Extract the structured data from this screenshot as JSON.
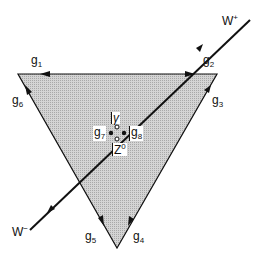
{
  "labels": {
    "g1": {
      "base": "g",
      "sub": "1"
    },
    "g2": {
      "base": "g",
      "sub": "2"
    },
    "g3": {
      "base": "g",
      "sub": "3"
    },
    "g4": {
      "base": "g",
      "sub": "4"
    },
    "g5": {
      "base": "g",
      "sub": "5"
    },
    "g6": {
      "base": "g",
      "sub": "6"
    },
    "g7": {
      "base": "g",
      "sub": "7"
    },
    "g8": {
      "base": "g",
      "sub": "8"
    },
    "gamma": "γ",
    "z0": {
      "base": "Z",
      "sup": "0"
    },
    "wplus": {
      "base": "W",
      "sup": "+"
    },
    "wminus": {
      "base": "W",
      "sup": "−"
    }
  }
}
